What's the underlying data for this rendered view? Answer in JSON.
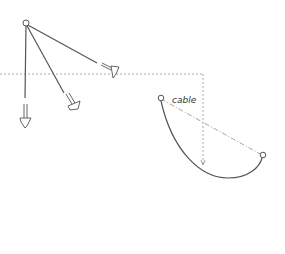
{
  "diagram": {
    "labels": {
      "cable": "cable"
    },
    "colors": {
      "stroke": "#555555",
      "dotted": "#999999",
      "background": "#ffffff"
    }
  }
}
